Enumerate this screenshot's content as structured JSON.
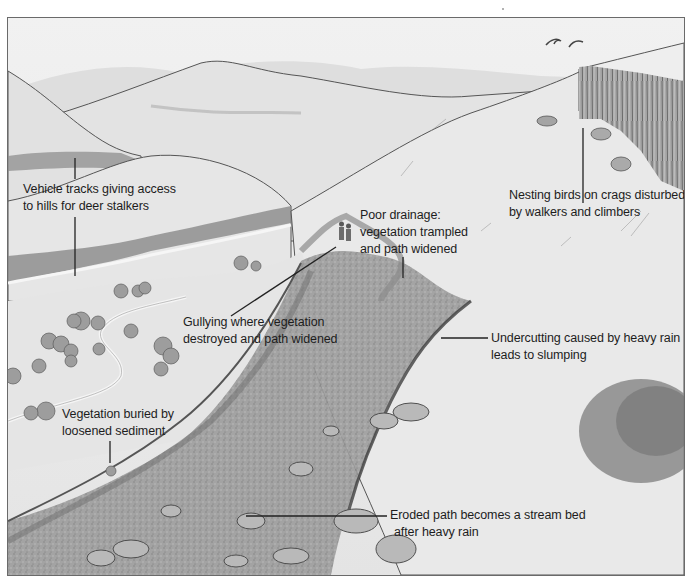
{
  "diagram": {
    "style": "monochrome pencil and wash illustration",
    "colors": {
      "sky": "#efefef",
      "hill_far": "#dcdcdc",
      "hill_mid": "#e2e2e2",
      "slope": "#e6e6e6",
      "path": "#9a9a9a",
      "rock_dark": "#5e5e5e",
      "outline": "#555555",
      "label_text": "#1d1d1d",
      "leader_line": "#222222"
    },
    "annotations": [
      {
        "id": "vehicle-tracks",
        "lines": [
          "Vehicle tracks giving access",
          "to hills for deer stalkers"
        ]
      },
      {
        "id": "poor-drainage",
        "lines": [
          "Poor drainage:",
          "vegetation trampled",
          "and path widened"
        ]
      },
      {
        "id": "nesting-birds",
        "lines": [
          "Nesting birds on crags disturbed",
          "by walkers and climbers"
        ]
      },
      {
        "id": "gullying",
        "lines": [
          "Gullying where vegetation",
          "destroyed and path widened"
        ]
      },
      {
        "id": "undercutting",
        "lines": [
          "Undercutting caused by heavy rain",
          "leads to slumping"
        ]
      },
      {
        "id": "vegetation-buried",
        "lines": [
          "Vegetation buried by",
          "loosened sediment"
        ]
      },
      {
        "id": "stream-bed",
        "lines": [
          "Eroded path becomes a stream bed",
          "after heavy rain"
        ]
      }
    ],
    "features": [
      "rolling hills",
      "crag cliff",
      "two birds",
      "two walkers",
      "winding track",
      "scattered shrubs",
      "eroded gully path",
      "boulders",
      "large bush"
    ]
  }
}
